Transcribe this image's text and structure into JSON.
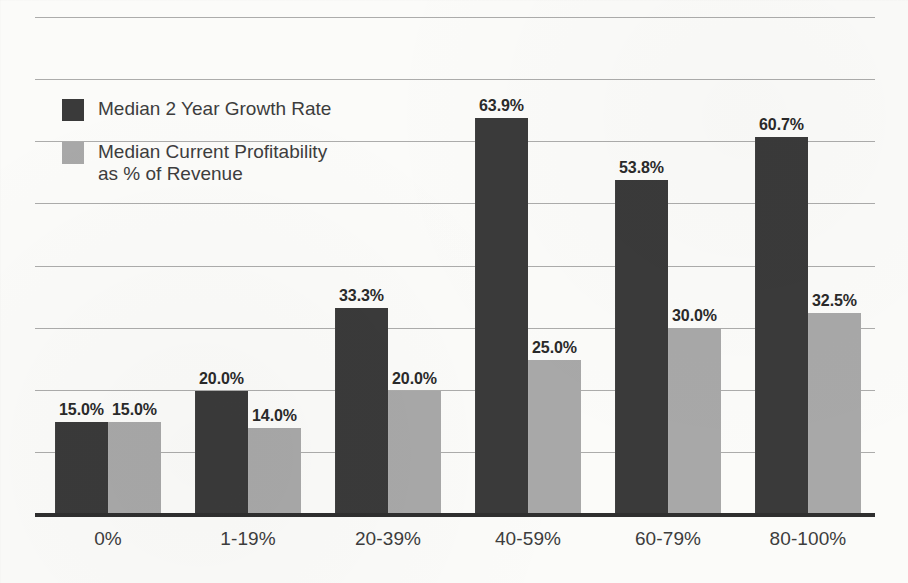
{
  "chart_data": {
    "type": "bar",
    "title": "",
    "subtitle": "",
    "xlabel": "",
    "ylabel": "",
    "grid": true,
    "legend_position": "inside-top-left",
    "ylim": [
      0,
      80
    ],
    "y_gridline_step": 10,
    "categories": [
      "0%",
      "1-19%",
      "20-39%",
      "40-59%",
      "60-79%",
      "80-100%"
    ],
    "series": [
      {
        "name": "Median 2 Year Growth Rate",
        "color": "#3a3a3a",
        "values": [
          15.0,
          20.0,
          33.3,
          63.9,
          53.8,
          60.7
        ],
        "labels": [
          "15.0%",
          "20.0%",
          "33.3%",
          "63.9%",
          "53.8%",
          "60.7%"
        ]
      },
      {
        "name": "Median Current Profitability as % of Revenue",
        "color": "#a8a8a8",
        "values": [
          15.0,
          14.0,
          20.0,
          25.0,
          30.0,
          32.5
        ],
        "labels": [
          "15.0%",
          "14.0%",
          "20.0%",
          "25.0%",
          "30.0%",
          "32.5%"
        ]
      }
    ]
  },
  "legend": {
    "items": [
      {
        "label": "Median 2 Year Growth Rate",
        "swatch": "dark",
        "color": "#3a3a3a"
      },
      {
        "label": "Median Current Profitability\nas % of Revenue",
        "swatch": "gray",
        "color": "#a8a8a8"
      }
    ]
  },
  "axes": {
    "categories": [
      "0%",
      "1-19%",
      "20-39%",
      "40-59%",
      "60-79%",
      "80-100%"
    ]
  },
  "style": {
    "background": "#fbfbf9",
    "gridline_color": "#9d9d9d",
    "axis_color": "#2f2f2f",
    "label_color": "#2a2a2a",
    "category_color": "#3d3d3d"
  }
}
